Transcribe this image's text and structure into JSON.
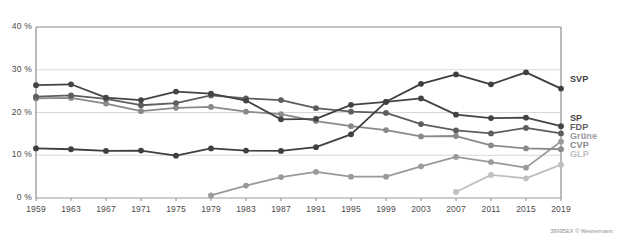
{
  "credit": "39995EX  © Westermann",
  "chart_data": {
    "type": "line",
    "title": "",
    "subtitle": "",
    "xlabel": "",
    "ylabel": "",
    "grid": true,
    "legend_position": "right",
    "ylim": [
      0,
      40
    ],
    "ytick_labels": [
      "0 %",
      "10 %",
      "20 %",
      "30 %",
      "40 %"
    ],
    "ytick_values": [
      0,
      10,
      20,
      30,
      40
    ],
    "categories": [
      1959,
      1963,
      1967,
      1971,
      1975,
      1979,
      1983,
      1987,
      1991,
      1995,
      1999,
      2003,
      2007,
      2011,
      2015,
      2019
    ],
    "xtick_labels": [
      "1959",
      "1963",
      "1967",
      "1971",
      "1975",
      "1979",
      "1983",
      "1987",
      "1991",
      "1995",
      "1999",
      "2003",
      "2007",
      "2011",
      "2015",
      "2019"
    ],
    "series": [
      {
        "name": "SVP",
        "color": "#3f3f3f",
        "values": [
          11.6,
          11.4,
          11.0,
          11.1,
          9.9,
          11.6,
          11.1,
          11.0,
          11.9,
          14.9,
          22.5,
          26.7,
          28.9,
          26.6,
          29.4,
          25.6
        ]
      },
      {
        "name": "SP",
        "color": "#444444",
        "values": [
          26.4,
          26.6,
          23.5,
          22.9,
          24.9,
          24.4,
          22.8,
          18.4,
          18.5,
          21.8,
          22.5,
          23.3,
          19.5,
          18.7,
          18.8,
          16.8
        ]
      },
      {
        "name": "FDP",
        "color": "#5e5e5e",
        "values": [
          23.7,
          24.0,
          23.2,
          21.7,
          22.2,
          24.0,
          23.3,
          22.9,
          21.0,
          20.2,
          19.9,
          17.3,
          15.8,
          15.1,
          16.4,
          15.1
        ]
      },
      {
        "name": "Grüne",
        "color": "#9a9a9a",
        "values": [
          null,
          null,
          null,
          null,
          null,
          0.6,
          2.9,
          4.9,
          6.1,
          5.0,
          5.0,
          7.4,
          9.6,
          8.4,
          7.1,
          13.2
        ]
      },
      {
        "name": "CVP",
        "color": "#8a8a8a",
        "values": [
          23.3,
          23.4,
          22.1,
          20.3,
          21.1,
          21.3,
          20.2,
          19.6,
          18.0,
          16.8,
          15.9,
          14.4,
          14.5,
          12.3,
          11.6,
          11.4
        ]
      },
      {
        "name": "GLP",
        "color": "#bfbfbf",
        "values": [
          null,
          null,
          null,
          null,
          null,
          null,
          null,
          null,
          null,
          null,
          null,
          null,
          1.4,
          5.4,
          4.6,
          7.8
        ]
      }
    ],
    "legend_entries": [
      {
        "label": "SVP",
        "color": "#3f3f3f",
        "value_at_end": 25.6
      },
      {
        "label": "SP",
        "color": "#444444",
        "value_at_end": 16.8
      },
      {
        "label": "FDP",
        "color": "#5e5e5e",
        "value_at_end": 15.1
      },
      {
        "label": "Grüne",
        "color": "#9a9a9a",
        "value_at_end": 13.2
      },
      {
        "label": "CVP",
        "color": "#8a8a8a",
        "value_at_end": 11.4
      },
      {
        "label": "GLP",
        "color": "#bfbfbf",
        "value_at_end": 7.8
      }
    ]
  }
}
